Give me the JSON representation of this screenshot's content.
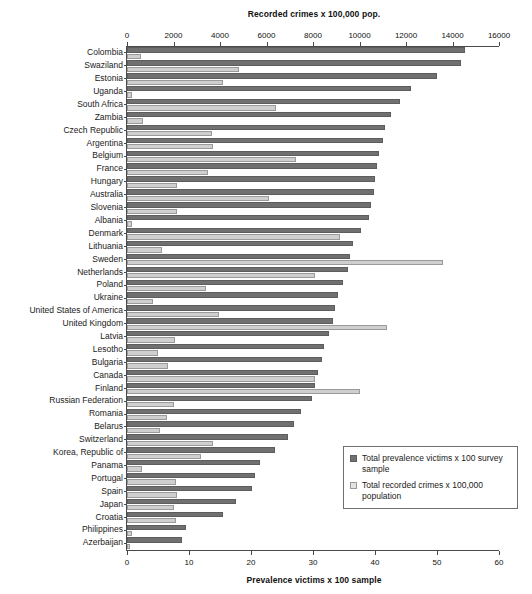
{
  "chart_data": {
    "type": "bar",
    "orientation": "horizontal",
    "title": "",
    "top_axis": {
      "label": "Recorded crimes x 100,000 pop.",
      "min": 0,
      "max": 16000,
      "ticks": [
        0,
        2000,
        4000,
        6000,
        8000,
        10000,
        12000,
        14000,
        16000
      ],
      "tick_labels": [
        "0",
        "2000",
        "4000",
        "6000",
        "8000",
        "10000",
        "12000",
        "14000",
        "16000"
      ]
    },
    "bottom_axis": {
      "label": "Prevalence victims x 100 sample",
      "min": 0,
      "max": 60,
      "ticks": [
        0,
        10,
        20,
        30,
        40,
        50,
        60
      ],
      "tick_labels": [
        "0",
        "10",
        "20",
        "30",
        "40",
        "50",
        "60"
      ]
    },
    "grid": false,
    "legend": {
      "position": "inside-bottom-right",
      "entries": [
        {
          "key": "prevalence",
          "label": "Total prevalence victims x 100 survey sample",
          "color": "#707070"
        },
        {
          "key": "recorded",
          "label": "Total recorded crimes x 100,000 population",
          "color": "#e2e2e2"
        }
      ]
    },
    "series": [
      {
        "name": "Total prevalence victims x 100 survey sample",
        "axis": "bottom",
        "color": "#707070"
      },
      {
        "name": "Total recorded crimes x 100,000 population",
        "axis": "top",
        "color": "#cfcfcf"
      }
    ],
    "categories": [
      "Colombia",
      "Swaziland",
      "Estonia",
      "Uganda",
      "South Africa",
      "Zambia",
      "Czech Republic",
      "Argentina",
      "Belgium",
      "France",
      "Hungary",
      "Australia",
      "Slovenia",
      "Albania",
      "Denmark",
      "Lithuania",
      "Sweden",
      "Netherlands",
      "Poland",
      "Ukraine",
      "United States of America",
      "United Kingdom",
      "Latvia",
      "Lesotho",
      "Bulgaria",
      "Canada",
      "Finland",
      "Russian Federation",
      "Romania",
      "Belarus",
      "Switzerland",
      "Korea, Republic of",
      "Panama",
      "Portugal",
      "Spain",
      "Japan",
      "Croatia",
      "Philippines",
      "Azerbaijan"
    ],
    "rows": [
      {
        "country": "Colombia",
        "prevalence": 54.5,
        "recorded": 620
      },
      {
        "country": "Swaziland",
        "prevalence": 53.8,
        "recorded": 4800
      },
      {
        "country": "Estonia",
        "prevalence": 50.0,
        "recorded": 4150
      },
      {
        "country": "Uganda",
        "prevalence": 45.8,
        "recorded": 230
      },
      {
        "country": "South Africa",
        "prevalence": 44.0,
        "recorded": 6400
      },
      {
        "country": "Zambia",
        "prevalence": 42.5,
        "recorded": 680
      },
      {
        "country": "Czech Republic",
        "prevalence": 41.6,
        "recorded": 3650
      },
      {
        "country": "Argentina",
        "prevalence": 41.3,
        "recorded": 3700
      },
      {
        "country": "Belgium",
        "prevalence": 40.6,
        "recorded": 7250
      },
      {
        "country": "France",
        "prevalence": 40.3,
        "recorded": 3500
      },
      {
        "country": "Hungary",
        "prevalence": 40.0,
        "recorded": 2150
      },
      {
        "country": "Australia",
        "prevalence": 39.8,
        "recorded": 6100
      },
      {
        "country": "Slovenia",
        "prevalence": 39.4,
        "recorded": 2150
      },
      {
        "country": "Albania",
        "prevalence": 39.0,
        "recorded": 210
      },
      {
        "country": "Denmark",
        "prevalence": 37.8,
        "recorded": 9150
      },
      {
        "country": "Lithuania",
        "prevalence": 36.5,
        "recorded": 1500
      },
      {
        "country": "Sweden",
        "prevalence": 36.0,
        "recorded": 13600
      },
      {
        "country": "Netherlands",
        "prevalence": 35.6,
        "recorded": 8100
      },
      {
        "country": "Poland",
        "prevalence": 34.8,
        "recorded": 3400
      },
      {
        "country": "Ukraine",
        "prevalence": 34.0,
        "recorded": 1100
      },
      {
        "country": "United States of America",
        "prevalence": 33.6,
        "recorded": 3950
      },
      {
        "country": "United Kingdom",
        "prevalence": 33.2,
        "recorded": 11200
      },
      {
        "country": "Latvia",
        "prevalence": 32.5,
        "recorded": 2050
      },
      {
        "country": "Lesotho",
        "prevalence": 31.8,
        "recorded": 1350
      },
      {
        "country": "Bulgaria",
        "prevalence": 31.5,
        "recorded": 1750
      },
      {
        "country": "Canada",
        "prevalence": 30.8,
        "recorded": 8100
      },
      {
        "country": "Finland",
        "prevalence": 30.4,
        "recorded": 10000
      },
      {
        "country": "Russian Federation",
        "prevalence": 29.9,
        "recorded": 2000
      },
      {
        "country": "Romania",
        "prevalence": 28.1,
        "recorded": 1700
      },
      {
        "country": "Belarus",
        "prevalence": 26.9,
        "recorded": 1400
      },
      {
        "country": "Switzerland",
        "prevalence": 26.0,
        "recorded": 3700
      },
      {
        "country": "Korea, Republic of",
        "prevalence": 23.8,
        "recorded": 3200
      },
      {
        "country": "Panama",
        "prevalence": 21.5,
        "recorded": 650
      },
      {
        "country": "Portugal",
        "prevalence": 20.6,
        "recorded": 2100
      },
      {
        "country": "Spain",
        "prevalence": 20.2,
        "recorded": 2150
      },
      {
        "country": "Japan",
        "prevalence": 17.6,
        "recorded": 2000
      },
      {
        "country": "Croatia",
        "prevalence": 15.5,
        "recorded": 2100
      },
      {
        "country": "Philippines",
        "prevalence": 9.5,
        "recorded": 230
      },
      {
        "country": "Azerbaijan",
        "prevalence": 8.8,
        "recorded": 150
      }
    ]
  },
  "caption": ""
}
